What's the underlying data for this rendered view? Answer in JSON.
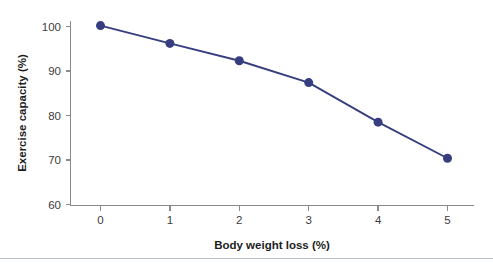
{
  "figure": {
    "background_color": "#ffffff",
    "divider_color": "#b9c0c8",
    "divider_y": 258
  },
  "chart_data": {
    "type": "line",
    "title": "",
    "subtitle": "",
    "xlabel": "Body weight loss (%)",
    "ylabel": "Exercise capacity (%)",
    "x": [
      0,
      1,
      2,
      3,
      4,
      5
    ],
    "values": [
      100.2,
      96.2,
      92.3,
      87.4,
      78.5,
      70.4
    ],
    "series": [
      {
        "name": "Exercise capacity",
        "values": [
          100.2,
          96.2,
          92.3,
          87.4,
          78.5,
          70.4
        ],
        "color": "#373e80",
        "marker": "circle",
        "marker_size": 9
      }
    ],
    "xlim": [
      -0.5,
      5.35
    ],
    "ylim": [
      60,
      101.5
    ],
    "xticks": [
      0,
      1,
      2,
      3,
      4,
      5
    ],
    "yticks": [
      60,
      70,
      80,
      90,
      100
    ],
    "xticklabels": [
      "0",
      "1",
      "2",
      "3",
      "4",
      "5"
    ],
    "yticklabels": [
      "60",
      "70",
      "80",
      "90",
      "100"
    ],
    "grid": false,
    "legend": false,
    "legend_position": "none",
    "annotations": [],
    "axis_color": "#8a8a8a",
    "tick_label_color": "#3c3c3c",
    "axis_title_color": "#1d1d1d"
  }
}
